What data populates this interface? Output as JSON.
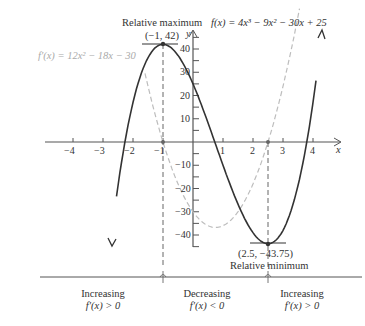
{
  "chart_data": {
    "type": "line",
    "title": "",
    "xlabel": "x",
    "ylabel": "y",
    "xlim": [
      -4.6,
      4.6
    ],
    "ylim": [
      -45,
      45
    ],
    "x_ticks": [
      -4,
      -3,
      -2,
      -1,
      1,
      2,
      3,
      4
    ],
    "x_tick_labels": [
      "−4",
      "−3",
      "−2",
      "−1",
      "1",
      "2",
      "3",
      "4"
    ],
    "y_ticks": [
      -40,
      -30,
      -20,
      -10,
      10,
      20,
      30,
      40
    ],
    "y_tick_labels": [
      "−40",
      "−30",
      "−20",
      "−10",
      "10",
      "20",
      "30",
      "40"
    ],
    "grid": false,
    "series": [
      {
        "name": "f(x) = 4x³ − 9x² − 30x + 25",
        "style": "solid",
        "color": "#333333",
        "x_range": [
          -2.55,
          4.1
        ],
        "coefficients": [
          4,
          -9,
          -30,
          25
        ]
      },
      {
        "name": "f'(x) = 12x² − 18x − 30",
        "style": "dashed",
        "color": "#b5b5b5",
        "x_range": [
          -1.6,
          3.55
        ],
        "coefficients": [
          0,
          12,
          -18,
          -30
        ]
      }
    ],
    "annotations": [
      {
        "text": "Relative maximum",
        "point": [
          -1,
          42
        ],
        "label": "(−1, 42)"
      },
      {
        "text": "Relative minimum",
        "point": [
          2.5,
          -43.75
        ],
        "label": "(2.5, −43.75)"
      }
    ]
  },
  "labels": {
    "rel_max": "Relative maximum",
    "rel_max_pt": "(−1, 42)",
    "f_eq": "f(x) = 4x³ − 9x² − 30x + 25",
    "fp_eq": "f′(x) = 12x² − 18x − 30",
    "rel_min_pt": "(2.5, −43.75)",
    "rel_min": "Relative minimum",
    "x_axis": "x",
    "y_axis": "y"
  },
  "intervals": [
    {
      "title": "Increasing",
      "cond": "f′(x) > 0"
    },
    {
      "title": "Decreasing",
      "cond": "f′(x) < 0"
    },
    {
      "title": "Increasing",
      "cond": "f′(x) > 0"
    }
  ]
}
